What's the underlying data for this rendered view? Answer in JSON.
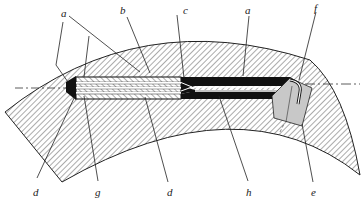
{
  "diagram": {
    "type": "cross-section",
    "labels": {
      "a_left": "a",
      "b": "b",
      "c": "c",
      "a_right": "a",
      "f": "f",
      "d_left": "d",
      "g": "g",
      "d_right": "d",
      "h": "h",
      "e": "e"
    },
    "colors": {
      "ink": "#222222",
      "hatch": "#444444",
      "fill_dark": "#111111",
      "fitting_fill": "#c8c8c8",
      "background": "#ffffff"
    }
  }
}
